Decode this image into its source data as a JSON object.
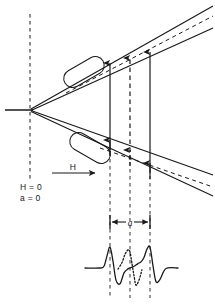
{
  "figure": {
    "title": "",
    "labels": {
      "field_arrow": "H",
      "field_zero": "H = 0",
      "spacing_zero": "a = 0",
      "spacing": "a"
    },
    "colors": {
      "ink": "#1a1a1a",
      "background": "#ffffff"
    },
    "geometry": {
      "apex": {
        "x": 30,
        "y": 110
      },
      "incoming_ray_start": {
        "x": 6,
        "y": 110
      },
      "reference_dashed_line": {
        "x": 30,
        "y_top": 14,
        "y_bottom": 182
      },
      "upper_beam_angle_deg": -34,
      "lower_beam_angle_deg": 34,
      "marker_columns_x": [
        110,
        130,
        150
      ]
    }
  },
  "chart_data": {
    "type": "line",
    "title": "",
    "xlabel": "",
    "ylabel": "",
    "grid": false,
    "legend": null,
    "xlim": [
      85,
      180
    ],
    "ylim": [
      -1.0,
      1.0
    ],
    "guide_lines_x": [
      110,
      130,
      150
    ],
    "series": [
      {
        "name": "outer-lines-solid",
        "style": "solid",
        "x": [
          85,
          100,
          104,
          107,
          110,
          113,
          116,
          120,
          124,
          128,
          130,
          132,
          135,
          138,
          141,
          144,
          147,
          150,
          153,
          156,
          160,
          166,
          178
        ],
        "y": [
          0,
          0,
          0.08,
          0.55,
          0.95,
          0.3,
          -0.55,
          -0.72,
          -0.22,
          -0.04,
          0,
          0.04,
          0.1,
          0.2,
          0.28,
          0.48,
          0.86,
          0.95,
          0.1,
          -0.62,
          -0.52,
          -0.02,
          0
        ]
      },
      {
        "name": "central-line-dotted",
        "style": "dotted",
        "x": [
          118,
          122,
          125,
          128,
          130,
          132,
          134,
          136,
          139,
          142
        ],
        "y": [
          -0.05,
          0.25,
          0.62,
          0.82,
          0.72,
          0.2,
          -0.35,
          -0.78,
          -0.55,
          -0.08
        ]
      }
    ]
  },
  "annotations": {
    "dimension_bar": {
      "label": "a",
      "x_start": 110,
      "x_end": 150,
      "y": 222
    },
    "field_arrow": {
      "label": "H",
      "x_start": 52,
      "x_end": 98,
      "y": 173
    },
    "zero_condition": {
      "lines": [
        "H = 0",
        "a = 0"
      ],
      "x": 22,
      "y": 186
    }
  }
}
